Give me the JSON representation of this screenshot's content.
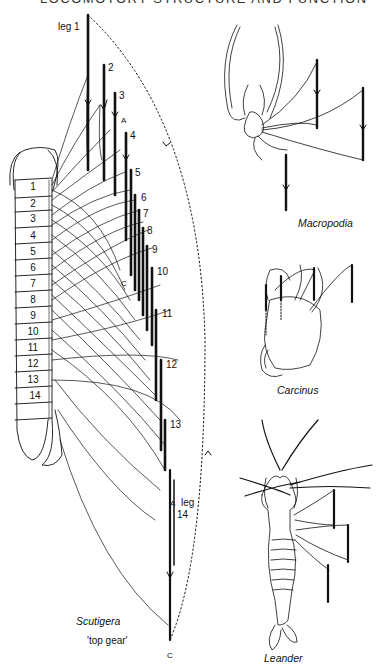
{
  "page": {
    "header": "LOCOMOTORY STRUCTURE AND FUNCTION"
  },
  "scutigera": {
    "name": "Scutigera",
    "gear_label": "'top gear'",
    "leg_label_first": "leg 1",
    "leg_labels": [
      "2",
      "3",
      "4",
      "5",
      "6",
      "7",
      "8",
      "9",
      "10",
      "11",
      "12",
      "13"
    ],
    "leg_label_last": "leg",
    "leg_label_last_num": "14",
    "segments": [
      "1",
      "2",
      "3",
      "4",
      "5",
      "6",
      "7",
      "8",
      "9",
      "10",
      "11",
      "12",
      "13",
      "14"
    ],
    "marker_A_top": "A",
    "marker_C_mid": "C",
    "marker_A_bottom": "A",
    "marker_C_bottom": "C"
  },
  "macropodia": {
    "name": "Macropodia"
  },
  "carcinus": {
    "name": "Carcinus"
  },
  "leander": {
    "name": "Leander"
  }
}
